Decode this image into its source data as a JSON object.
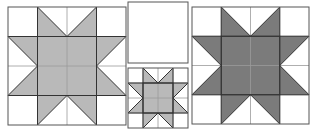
{
  "diagram": {
    "colors": {
      "background": "#ffffff",
      "light_fill": "#b9b9b9",
      "dark_fill": "#7b7b7b",
      "grid_line": "#9a9a9a",
      "outline": "#555555"
    },
    "blocks": [
      {
        "id": "large-light-star",
        "x": 8,
        "y": 7,
        "size": 118,
        "fill": "light",
        "grid": 4
      },
      {
        "id": "blank-square",
        "x": 128,
        "y": 2,
        "width": 60,
        "height": 61,
        "fill": "none"
      },
      {
        "id": "small-light-star",
        "x": 128,
        "y": 68,
        "size": 60,
        "fill": "light",
        "grid": 4
      },
      {
        "id": "large-dark-star",
        "x": 192,
        "y": 7,
        "size": 117,
        "fill": "dark",
        "grid": 4
      }
    ]
  }
}
